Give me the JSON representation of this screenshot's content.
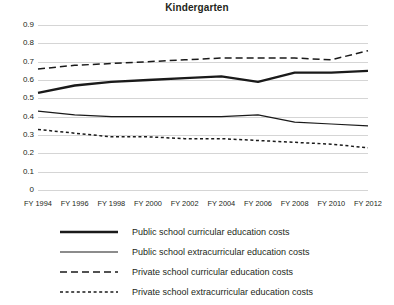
{
  "chart_data": {
    "type": "line",
    "title": "Kindergarten",
    "xlabel": "",
    "ylabel": "",
    "ylim": [
      0,
      0.9
    ],
    "ytick_labels": [
      "0.9",
      "0.8",
      "0.7",
      "0.6",
      "0.5",
      "0.4",
      "0.3",
      "0.2",
      "0.1",
      "0"
    ],
    "ytick_values": [
      0.9,
      0.8,
      0.7,
      0.6,
      0.5,
      0.4,
      0.3,
      0.2,
      0.1,
      0
    ],
    "grid": true,
    "legend_position": "below",
    "categories": [
      "FY 1994",
      "FY 1996",
      "FY 1998",
      "FY 2000",
      "FY 2002",
      "FY 2004",
      "FY 2006",
      "FY 2008",
      "FY 2010",
      "FY 2012"
    ],
    "x": [
      1994,
      1996,
      1998,
      2000,
      2002,
      2004,
      2006,
      2008,
      2010,
      2012
    ],
    "series": [
      {
        "name": "Public school curricular education costs",
        "style": "solid-thick",
        "values": [
          0.53,
          0.57,
          0.59,
          0.6,
          0.61,
          0.62,
          0.59,
          0.64,
          0.64,
          0.65
        ]
      },
      {
        "name": "Public school extracurricular education costs",
        "style": "solid-thin",
        "values": [
          0.43,
          0.41,
          0.4,
          0.4,
          0.4,
          0.4,
          0.41,
          0.37,
          0.36,
          0.35
        ]
      },
      {
        "name": "Private school curricular education costs",
        "style": "dashed-long",
        "values": [
          0.66,
          0.68,
          0.69,
          0.7,
          0.71,
          0.72,
          0.72,
          0.72,
          0.71,
          0.76
        ]
      },
      {
        "name": "Private school extracurricular education costs",
        "style": "dashed-short",
        "values": [
          0.33,
          0.31,
          0.29,
          0.29,
          0.28,
          0.28,
          0.27,
          0.26,
          0.25,
          0.23
        ]
      }
    ],
    "colors": {
      "line": "#1a1a1a",
      "gridline": "#d5d5d5",
      "text": "#231f20",
      "background": "#ffffff"
    }
  },
  "legend": {
    "items": [
      {
        "label": "Public school curricular education costs",
        "style": "solid-thick"
      },
      {
        "label": "Public school extracurricular education costs",
        "style": "solid-thin"
      },
      {
        "label": "Private school curricular education costs",
        "style": "dashed-long"
      },
      {
        "label": "Private school extracurricular education costs",
        "style": "dashed-short"
      }
    ]
  }
}
